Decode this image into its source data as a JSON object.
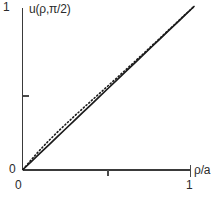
{
  "figure": {
    "background_color": "#ffffff",
    "ink_color": "#1b1b1b",
    "axis_color": "#3a3a3a"
  },
  "labels": {
    "y_axis_title": "u(ρ,π/2)",
    "y_tick_top": "1",
    "y_tick_origin": "0",
    "x_tick_origin": "0",
    "x_tick_end": "1",
    "x_axis_title": "ρ/a"
  },
  "chart_data": {
    "type": "line",
    "title": "",
    "subtitle": "",
    "xlabel": "ρ/a",
    "ylabel": "u(ρ,π/2)",
    "xlim": [
      0,
      1
    ],
    "ylim": [
      0,
      1
    ],
    "xticks": [
      0,
      0.5,
      1
    ],
    "xticklabels": [
      "0",
      "",
      "1"
    ],
    "yticks": [
      0,
      0.5,
      1
    ],
    "yticklabels": [
      "0",
      "",
      "1"
    ],
    "grid": false,
    "legend": false,
    "legend_position": "none",
    "annotations": [],
    "x": [
      0.0,
      0.05,
      0.1,
      0.15,
      0.2,
      0.25,
      0.3,
      0.35,
      0.4,
      0.45,
      0.5,
      0.55,
      0.6,
      0.65,
      0.7,
      0.75,
      0.8,
      0.85,
      0.9,
      0.95,
      1.0
    ],
    "series": [
      {
        "name": "exact",
        "style": "solid",
        "color": "#1b1b1b",
        "values": [
          0.0,
          0.05,
          0.1,
          0.15,
          0.2,
          0.25,
          0.3,
          0.35,
          0.4,
          0.45,
          0.5,
          0.55,
          0.6,
          0.65,
          0.7,
          0.75,
          0.8,
          0.85,
          0.9,
          0.95,
          1.0
        ]
      },
      {
        "name": "series-approximation",
        "style": "dotted",
        "color": "#1b1b1b",
        "values": [
          0.0,
          0.062,
          0.121,
          0.176,
          0.228,
          0.278,
          0.327,
          0.375,
          0.422,
          0.469,
          0.516,
          0.563,
          0.611,
          0.659,
          0.707,
          0.756,
          0.805,
          0.854,
          0.903,
          0.952,
          1.0
        ]
      }
    ]
  }
}
